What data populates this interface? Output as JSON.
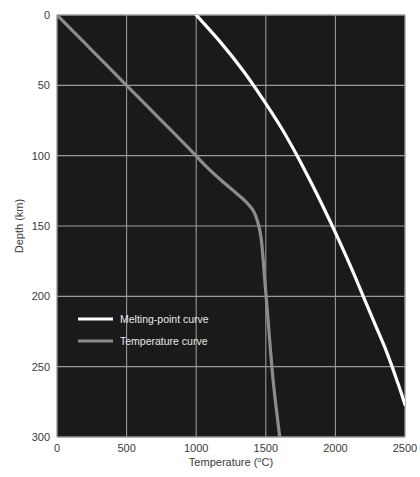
{
  "chart_data": {
    "type": "line",
    "title": "",
    "xlabel": "Temperature (°C)",
    "ylabel": "Depth (km)",
    "xlim": [
      0,
      2500
    ],
    "ylim": [
      0,
      300
    ],
    "y_inverted": true,
    "grid": true,
    "xticks": [
      0,
      500,
      1000,
      1500,
      2000,
      2500
    ],
    "xticklabels": [
      "0",
      "500",
      "1000",
      "1500",
      "2000",
      "2500"
    ],
    "yticks": [
      0,
      50,
      100,
      150,
      200,
      250,
      300
    ],
    "yticklabels": [
      "0",
      "50",
      "100",
      "150",
      "200",
      "250",
      "300"
    ],
    "legend_position": "center-left",
    "background_color": "#1a1a1a",
    "grid_color": "#9a9a9a",
    "series": [
      {
        "name": "Melting-point curve",
        "color": "#ffffff",
        "linewidth": 3.2,
        "x": [
          1000,
          1180,
          1340,
          1480,
          1610,
          1725,
          1830,
          1930,
          2025,
          2115,
          2200,
          2285,
          2370,
          2450,
          2500
        ],
        "y": [
          0,
          20,
          40,
          60,
          80,
          100,
          120,
          140,
          160,
          180,
          200,
          220,
          240,
          262,
          277
        ]
      },
      {
        "name": "Temperature curve",
        "color": "#8c8c8c",
        "linewidth": 3.2,
        "x": [
          0,
          120,
          240,
          360,
          480,
          600,
          720,
          840,
          960,
          1075,
          1185,
          1280,
          1360,
          1415,
          1450,
          1468,
          1482,
          1498,
          1515,
          1535,
          1555,
          1578,
          1600
        ],
        "y": [
          0,
          12,
          24,
          36,
          48,
          60,
          72,
          84,
          96,
          108,
          118,
          126,
          133,
          140,
          150,
          160,
          175,
          195,
          215,
          240,
          262,
          282,
          300
        ]
      }
    ]
  },
  "legend": {
    "items": [
      {
        "label": "Melting-point curve",
        "color": "#ffffff"
      },
      {
        "label": "Temperature curve",
        "color": "#8c8c8c"
      }
    ]
  },
  "axes": {
    "x_title_main": "Temperature (",
    "x_title_degree": "o",
    "x_title_tail": "C)",
    "y_title": "Depth (km)"
  }
}
